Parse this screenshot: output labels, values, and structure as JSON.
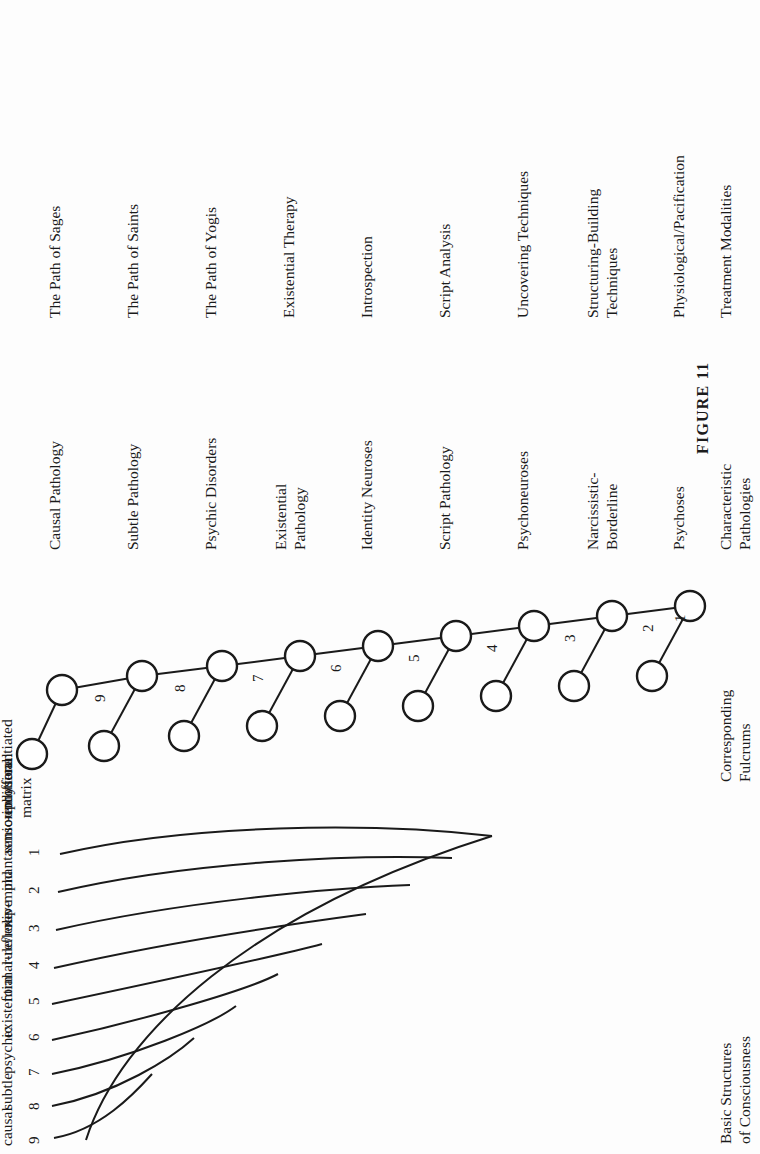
{
  "figure": {
    "caption": "FIGURE 11",
    "rotation_degrees": -90
  },
  "columns": {
    "basic_structures": {
      "header": "Basic Structures\nof Consciousness",
      "levels": [
        {
          "number": "9",
          "label": "causal"
        },
        {
          "number": "8",
          "label": "subtle"
        },
        {
          "number": "7",
          "label": "psychic"
        },
        {
          "number": "6",
          "label": "existential"
        },
        {
          "number": "5",
          "label": "formal-reflexive"
        },
        {
          "number": "4",
          "label": "rule/role"
        },
        {
          "number": "3",
          "label": "rep-mind"
        },
        {
          "number": "2",
          "label": "phantasmic-emotional"
        },
        {
          "number": "1",
          "label": "sensoriphysical"
        },
        {
          "number": "",
          "label": "undifferentiated\nmatrix"
        }
      ]
    },
    "fulcrums": {
      "header": "Corresponding\nFulcrums",
      "numbers": [
        "9",
        "8",
        "7",
        "6",
        "5",
        "4",
        "3",
        "2",
        "1"
      ]
    },
    "pathologies": {
      "header": "Characteristic\nPathologies",
      "items": [
        "Causal Pathology",
        "Subtle Pathology",
        "Psychic Disorders",
        "Existential\nPathology",
        "Identity Neuroses",
        "Script Pathology",
        "Psychoneuroses",
        "Narcissistic-\nBorderline",
        "Psychoses"
      ]
    },
    "treatments": {
      "header": "Treatment Modalities",
      "items": [
        "The Path of Sages",
        "The Path of Saints",
        "The Path of Yogis",
        "Existential Therapy",
        "Introspection",
        "Script Analysis",
        "Uncovering Techniques",
        "Structuring-Building\nTechniques",
        "Physiological/Pacification"
      ]
    }
  },
  "colors": {
    "ink": "#1a1a1a",
    "paper": "#fdfdfd",
    "node_fill": "#ffffff"
  }
}
